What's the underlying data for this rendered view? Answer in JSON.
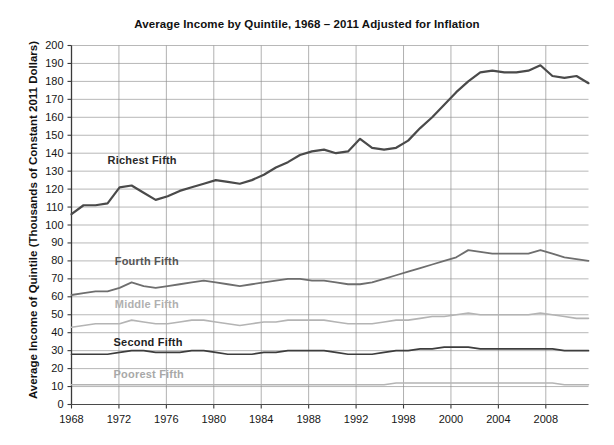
{
  "chart_data": {
    "type": "line",
    "title": "Average Income by Quintile, 1968 – 2011 Adjusted for Inflation",
    "xlabel": "",
    "ylabel": "Average Income of Quintile (Thousands of Constant 2011 Dollars)",
    "ylim": [
      0,
      200
    ],
    "ytick_step": 10,
    "yticks": [
      "200",
      "190",
      "180",
      "170",
      "160",
      "150",
      "140",
      "130",
      "120",
      "110",
      "100",
      "90",
      "80",
      "70",
      "60",
      "50",
      "40",
      "30",
      "20",
      "10",
      "0"
    ],
    "xticks": [
      "1968",
      "1972",
      "1976",
      "1980",
      "1984",
      "1988",
      "1992",
      "1998",
      "2000",
      "2004",
      "2008"
    ],
    "xlim": [
      1968,
      2011
    ],
    "grid": "horizontal-and-vertical",
    "legend_position": "inline-labels",
    "x": [
      1968,
      1969,
      1970,
      1971,
      1972,
      1973,
      1974,
      1975,
      1976,
      1977,
      1978,
      1979,
      1980,
      1981,
      1982,
      1983,
      1984,
      1985,
      1986,
      1987,
      1988,
      1989,
      1990,
      1991,
      1992,
      1993,
      1994,
      1995,
      1996,
      1997,
      1998,
      1999,
      2000,
      2001,
      2002,
      2003,
      2004,
      2005,
      2006,
      2007,
      2008,
      2009,
      2010,
      2011
    ],
    "series": [
      {
        "name": "Richest Fifth",
        "color": "#4a4a4a",
        "label_color": "#2a2a2a",
        "width": 2.2,
        "label_x": 1971.0,
        "label_y": 136,
        "values": [
          106,
          111,
          111,
          112,
          121,
          122,
          118,
          114,
          116,
          119,
          121,
          123,
          125,
          124,
          123,
          125,
          128,
          132,
          135,
          139,
          141,
          142,
          140,
          141,
          148,
          143,
          142,
          143,
          147,
          154,
          160,
          167,
          174,
          180,
          185,
          186,
          185,
          185,
          186,
          189,
          183,
          182,
          183,
          179
        ]
      },
      {
        "name": "Fourth Fifth",
        "color": "#6e6e6e",
        "label_color": "#555555",
        "width": 1.8,
        "label_x": 1971.6,
        "label_y": 80,
        "values": [
          61,
          62,
          63,
          63,
          65,
          68,
          66,
          65,
          66,
          67,
          68,
          69,
          68,
          67,
          66,
          67,
          68,
          69,
          70,
          70,
          69,
          69,
          68,
          67,
          67,
          68,
          70,
          72,
          74,
          76,
          78,
          80,
          82,
          86,
          85,
          84,
          84,
          84,
          84,
          86,
          84,
          82,
          81,
          80
        ]
      },
      {
        "name": "Middle Fifth",
        "color": "#b4b4b4",
        "label_color": "#b0b0b0",
        "width": 1.6,
        "label_x": 1971.6,
        "label_y": 56,
        "values": [
          43,
          44,
          45,
          45,
          45,
          47,
          46,
          45,
          45,
          46,
          47,
          47,
          46,
          45,
          44,
          45,
          46,
          46,
          47,
          47,
          47,
          47,
          46,
          45,
          45,
          45,
          46,
          47,
          47,
          48,
          49,
          49,
          50,
          51,
          50,
          50,
          50,
          50,
          50,
          51,
          50,
          49,
          48,
          48
        ]
      },
      {
        "name": "Second Fifth",
        "color": "#3d3d3d",
        "label_color": "#1f1f1f",
        "width": 1.7,
        "label_x": 1971.5,
        "label_y": 35,
        "values": [
          28,
          28,
          28,
          28,
          29,
          30,
          30,
          29,
          29,
          29,
          30,
          30,
          29,
          28,
          28,
          28,
          29,
          29,
          30,
          30,
          30,
          30,
          29,
          28,
          28,
          28,
          29,
          30,
          30,
          31,
          31,
          32,
          32,
          32,
          31,
          31,
          31,
          31,
          31,
          31,
          31,
          30,
          30,
          30
        ]
      },
      {
        "name": "Poorest Fifth",
        "color": "#b4b4b4",
        "label_color": "#a8a8a8",
        "width": 1.5,
        "label_x": 1971.5,
        "label_y": 17,
        "values": [
          11,
          11,
          11,
          11,
          11,
          11,
          11,
          11,
          11,
          11,
          11,
          11,
          11,
          11,
          11,
          11,
          11,
          11,
          11,
          11,
          11,
          11,
          11,
          11,
          11,
          11,
          11,
          12,
          12,
          12,
          12,
          12,
          12,
          12,
          12,
          12,
          12,
          12,
          12,
          12,
          12,
          11,
          11,
          11
        ]
      }
    ]
  }
}
